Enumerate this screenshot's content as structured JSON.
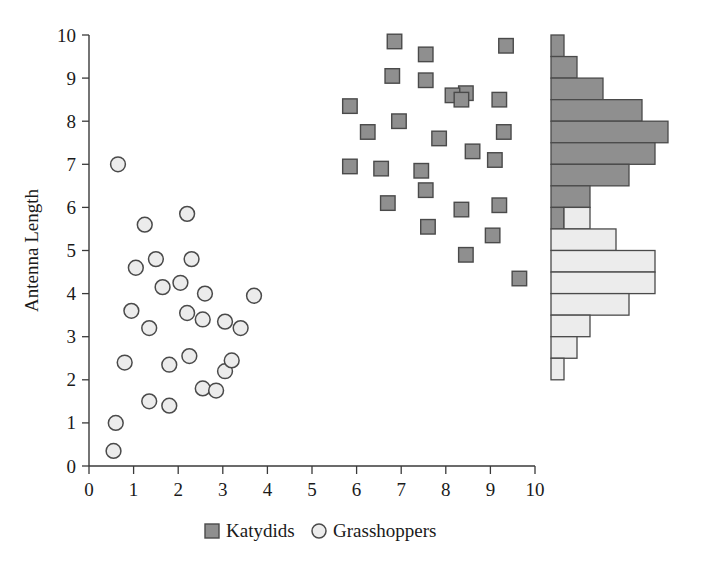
{
  "figure": {
    "title": "",
    "background_color": "#ffffff"
  },
  "axes": {
    "y_title": "Antenna Length",
    "x_title": "",
    "x_ticks": [
      "0",
      "1",
      "2",
      "3",
      "4",
      "5",
      "6",
      "7",
      "8",
      "9",
      "10"
    ],
    "y_ticks": [
      "0",
      "1",
      "2",
      "3",
      "4",
      "5",
      "6",
      "7",
      "8",
      "9",
      "10"
    ],
    "xlim": [
      0,
      10
    ],
    "ylim": [
      0,
      10
    ]
  },
  "legend": {
    "position": "bottom-center",
    "items": [
      {
        "label": "Katydids",
        "marker": "square",
        "color": "#8f8f8f"
      },
      {
        "label": "Grasshoppers",
        "marker": "circle",
        "color": "#ececec"
      }
    ]
  },
  "colors": {
    "katydid_fill": "#8f8f8f",
    "katydid_edge": "#4a4a4a",
    "grasshopper_fill": "#ececec",
    "grasshopper_edge": "#4a4a4a",
    "axis": "#3a3a3a",
    "text": "#1a1a1a"
  },
  "chart_data": {
    "type": "scatter",
    "title": "",
    "xlabel": "",
    "ylabel": "Antenna Length",
    "xlim": [
      0,
      10
    ],
    "ylim": [
      0,
      10
    ],
    "grid": false,
    "legend_position": "bottom-center",
    "series": [
      {
        "name": "Katydids",
        "marker": "square",
        "color": "#8f8f8f",
        "points": [
          [
            6.85,
            9.85
          ],
          [
            9.35,
            9.75
          ],
          [
            7.55,
            9.55
          ],
          [
            6.8,
            9.05
          ],
          [
            7.55,
            8.95
          ],
          [
            8.45,
            8.65
          ],
          [
            8.15,
            8.6
          ],
          [
            8.35,
            8.5
          ],
          [
            9.2,
            8.5
          ],
          [
            5.85,
            8.35
          ],
          [
            6.95,
            8.0
          ],
          [
            6.25,
            7.75
          ],
          [
            9.3,
            7.75
          ],
          [
            7.85,
            7.6
          ],
          [
            8.6,
            7.3
          ],
          [
            9.1,
            7.1
          ],
          [
            5.85,
            6.95
          ],
          [
            6.55,
            6.9
          ],
          [
            7.45,
            6.85
          ],
          [
            7.55,
            6.4
          ],
          [
            6.7,
            6.1
          ],
          [
            9.2,
            6.05
          ],
          [
            8.35,
            5.95
          ],
          [
            7.6,
            5.55
          ],
          [
            8.45,
            4.9
          ],
          [
            9.05,
            5.35
          ],
          [
            9.65,
            4.35
          ]
        ]
      },
      {
        "name": "Grasshoppers",
        "marker": "circle",
        "color": "#ececec",
        "points": [
          [
            0.65,
            7.0
          ],
          [
            1.25,
            5.6
          ],
          [
            2.2,
            5.85
          ],
          [
            1.5,
            4.8
          ],
          [
            2.3,
            4.8
          ],
          [
            1.05,
            4.6
          ],
          [
            2.05,
            4.25
          ],
          [
            1.65,
            4.15
          ],
          [
            2.6,
            4.0
          ],
          [
            3.7,
            3.95
          ],
          [
            0.95,
            3.6
          ],
          [
            2.2,
            3.55
          ],
          [
            1.35,
            3.2
          ],
          [
            2.55,
            3.4
          ],
          [
            3.05,
            3.35
          ],
          [
            3.4,
            3.2
          ],
          [
            0.8,
            2.4
          ],
          [
            2.25,
            2.55
          ],
          [
            1.8,
            2.35
          ],
          [
            3.05,
            2.2
          ],
          [
            2.55,
            1.8
          ],
          [
            1.35,
            1.5
          ],
          [
            1.8,
            1.4
          ],
          [
            2.85,
            1.75
          ],
          [
            0.6,
            1.0
          ],
          [
            0.55,
            0.35
          ],
          [
            3.2,
            2.45
          ]
        ]
      }
    ],
    "marginal_histogram": {
      "type": "bar",
      "orientation": "horizontal",
      "axis": "y",
      "position": "right",
      "bin_width": 0.5,
      "description": "Stacked marginal distribution of Antenna Length; dark bars = Katydids, light bars = Grasshoppers",
      "bins": [
        {
          "y_low": 9.5,
          "y_high": 10.0,
          "katydids": 1,
          "grasshoppers": 0
        },
        {
          "y_low": 9.0,
          "y_high": 9.5,
          "katydids": 2,
          "grasshoppers": 0
        },
        {
          "y_low": 8.5,
          "y_high": 9.0,
          "katydids": 4,
          "grasshoppers": 0
        },
        {
          "y_low": 8.0,
          "y_high": 8.5,
          "katydids": 7,
          "grasshoppers": 0
        },
        {
          "y_low": 7.5,
          "y_high": 8.0,
          "katydids": 9,
          "grasshoppers": 0
        },
        {
          "y_low": 7.0,
          "y_high": 7.5,
          "katydids": 8,
          "grasshoppers": 0
        },
        {
          "y_low": 6.5,
          "y_high": 7.0,
          "katydids": 6,
          "grasshoppers": 0
        },
        {
          "y_low": 6.0,
          "y_high": 6.5,
          "katydids": 3,
          "grasshoppers": 0
        },
        {
          "y_low": 5.5,
          "y_high": 6.0,
          "katydids": 1,
          "grasshoppers": 2
        },
        {
          "y_low": 5.0,
          "y_high": 5.5,
          "katydids": 0,
          "grasshoppers": 5
        },
        {
          "y_low": 4.5,
          "y_high": 5.0,
          "katydids": 0,
          "grasshoppers": 8
        },
        {
          "y_low": 4.0,
          "y_high": 4.5,
          "katydids": 0,
          "grasshoppers": 8
        },
        {
          "y_low": 3.5,
          "y_high": 4.0,
          "katydids": 0,
          "grasshoppers": 6
        },
        {
          "y_low": 3.0,
          "y_high": 3.5,
          "katydids": 0,
          "grasshoppers": 3
        },
        {
          "y_low": 2.5,
          "y_high": 3.0,
          "katydids": 0,
          "grasshoppers": 2
        },
        {
          "y_low": 2.0,
          "y_high": 2.5,
          "katydids": 0,
          "grasshoppers": 1
        }
      ]
    }
  }
}
